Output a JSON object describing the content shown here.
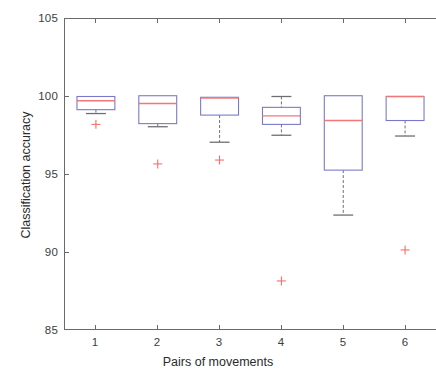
{
  "chart_data": {
    "type": "box",
    "title": "",
    "xlabel": "Pairs of movements",
    "ylabel": "Classification accuracy",
    "xlim": [
      0.5,
      6.5
    ],
    "ylim": [
      85,
      105
    ],
    "yticks": [
      85,
      90,
      95,
      100,
      105
    ],
    "ytick_labels": [
      "85",
      "90",
      "95",
      "100",
      "105"
    ],
    "xticks": [
      1,
      2,
      3,
      4,
      5,
      6
    ],
    "xtick_labels": [
      "1",
      "2",
      "3",
      "4",
      "5",
      "6"
    ],
    "grid": false,
    "legend": null,
    "box_color": "#7a79c9",
    "median_color": "#f07878",
    "whisker_color": "#6f6f6f",
    "outlier_color": "#f4706a",
    "axis_color": "#6a6a6a",
    "boxes": [
      {
        "category": "1",
        "x": 1,
        "whisker_low": 98.9,
        "q1": 99.15,
        "median": 99.73,
        "q3": 100.0,
        "whisker_high": 100.0,
        "outliers": [
          98.2
        ]
      },
      {
        "category": "2",
        "x": 2,
        "whisker_low": 98.05,
        "q1": 98.25,
        "median": 99.55,
        "q3": 100.05,
        "whisker_high": 100.05,
        "outliers": [
          95.65
        ]
      },
      {
        "category": "3",
        "x": 3,
        "whisker_low": 97.05,
        "q1": 98.8,
        "median": 99.9,
        "q3": 99.95,
        "whisker_high": 99.95,
        "outliers": [
          95.9
        ]
      },
      {
        "category": "4",
        "x": 4,
        "whisker_low": 97.5,
        "q1": 98.2,
        "median": 98.75,
        "q3": 99.3,
        "whisker_high": 100.0,
        "outliers": [
          88.1
        ]
      },
      {
        "category": "5",
        "x": 5,
        "whisker_low": 92.35,
        "q1": 95.25,
        "median": 98.45,
        "q3": 100.05,
        "whisker_high": 100.05,
        "outliers": []
      },
      {
        "category": "6",
        "x": 6,
        "whisker_low": 97.45,
        "q1": 98.45,
        "median": 100.0,
        "q3": 100.0,
        "whisker_high": 100.0,
        "outliers": [
          90.1
        ]
      }
    ]
  }
}
